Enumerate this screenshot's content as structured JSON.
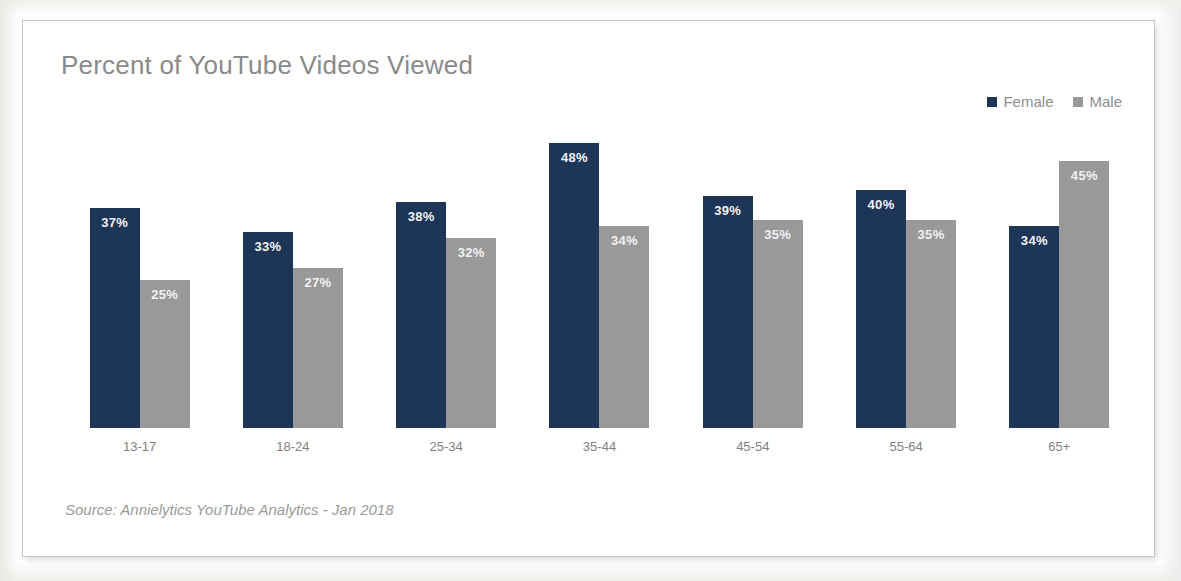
{
  "chart": {
    "title": "Percent of YouTube Videos Viewed",
    "source_note": "Source: Annielytics YouTube Analytics - Jan 2018"
  },
  "legend": {
    "position": "top-right",
    "items": [
      {
        "label": "Female",
        "color": "#1d3557",
        "marker": "square-marker-icon"
      },
      {
        "label": "Male",
        "color": "#999999",
        "marker": "square-marker-icon"
      }
    ]
  },
  "chart_data": {
    "type": "bar",
    "title": "Percent of YouTube Videos Viewed",
    "subtitle": "",
    "xlabel": "",
    "ylabel": "",
    "ylim": [
      0,
      50
    ],
    "grid": false,
    "legend_position": "top-right",
    "value_label_format": "{v}%",
    "categories": [
      "13-17",
      "18-24",
      "25-34",
      "35-44",
      "45-54",
      "55-64",
      "65+"
    ],
    "series": [
      {
        "name": "Female",
        "color": "#1d3557",
        "values": [
          37,
          33,
          38,
          48,
          39,
          40,
          34
        ],
        "labels": [
          "37%",
          "33%",
          "38%",
          "48%",
          "39%",
          "40%",
          "34%"
        ]
      },
      {
        "name": "Male",
        "color": "#999999",
        "values": [
          25,
          27,
          32,
          34,
          35,
          35,
          45
        ],
        "labels": [
          "25%",
          "27%",
          "32%",
          "34%",
          "35%",
          "35%",
          "45%"
        ]
      }
    ],
    "annotations": [
      "Source: Annielytics YouTube Analytics - Jan 2018"
    ]
  }
}
